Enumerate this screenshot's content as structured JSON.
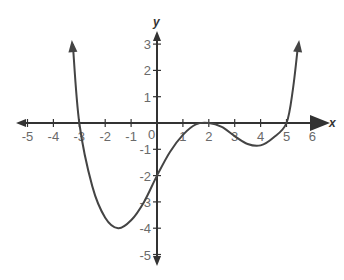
{
  "chart_data": {
    "type": "line",
    "title": "",
    "xlabel": "x",
    "ylabel": "y",
    "xlim": [
      -5.4,
      6.4
    ],
    "ylim": [
      -5.4,
      3.6
    ],
    "grid": false,
    "x_ticks": [
      -5,
      -4,
      -3,
      -2,
      -1,
      1,
      2,
      3,
      4,
      5,
      6
    ],
    "y_ticks": [
      3,
      2,
      1,
      -1,
      -2,
      -3,
      -4,
      -5
    ],
    "origin_label": "0",
    "series": [
      {
        "name": "f(x)",
        "color": "#444444",
        "arrows_at_ends": true,
        "x": [
          -3.25,
          -3,
          -2.5,
          -2,
          -1.5,
          -1,
          -0.5,
          0,
          0.5,
          1,
          1.5,
          2,
          2.5,
          3,
          3.5,
          4,
          4.5,
          5,
          5.25,
          5.45
        ],
        "y": [
          3,
          0,
          -2.4,
          -3.6,
          -4,
          -3.7,
          -3,
          -2,
          -1.1,
          -0.45,
          -0.05,
          0,
          -0.15,
          -0.5,
          -0.8,
          -0.85,
          -0.55,
          0,
          1.3,
          3
        ]
      }
    ],
    "key_points": {
      "x_intercepts": [
        -3,
        2,
        5
      ],
      "y_intercept": -2,
      "local_min_1": [
        -1.5,
        -4
      ],
      "local_max_touch": [
        2,
        0
      ],
      "local_min_2": [
        4,
        -0.85
      ]
    }
  },
  "axes": {
    "x_label": "x",
    "y_label": "y",
    "origin": "0"
  }
}
